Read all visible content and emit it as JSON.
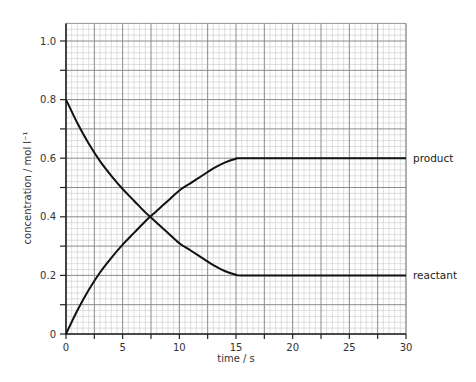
{
  "chart_data": {
    "type": "line",
    "title": "",
    "xlabel": "time / s",
    "ylabel": "concentration / mol l⁻¹",
    "xlim": [
      0,
      30
    ],
    "ylim": [
      0,
      1.06
    ],
    "x_ticks": [
      0,
      5,
      10,
      15,
      20,
      25,
      30
    ],
    "x_tick_labels": [
      "0",
      "5",
      "10",
      "15",
      "20",
      "25",
      "30"
    ],
    "x_minor_ticks": [
      2.5,
      7.5,
      12.5,
      17.5,
      22.5,
      27.5
    ],
    "y_ticks": [
      0,
      0.2,
      0.4,
      0.6,
      0.8,
      1.0
    ],
    "y_tick_labels": [
      "0",
      "0.2",
      "0.4",
      "0.6",
      "0.8",
      "1.0"
    ],
    "y_minor_ticks": [
      0.1,
      0.3,
      0.5,
      0.7,
      0.9
    ],
    "grid": {
      "on": true,
      "major_x": 2.5,
      "major_y": 0.1,
      "minor_x": 0.5,
      "minor_y": 0.02
    },
    "legend": {
      "position": "right-inline"
    },
    "series": [
      {
        "name": "product",
        "label": "product",
        "x": [
          0,
          1,
          2,
          3,
          4,
          5,
          6,
          7,
          8,
          9,
          10,
          11,
          12,
          13,
          14,
          15,
          15.5,
          20,
          25,
          30
        ],
        "values": [
          0,
          0.08,
          0.15,
          0.21,
          0.26,
          0.305,
          0.345,
          0.385,
          0.42,
          0.455,
          0.49,
          0.515,
          0.54,
          0.565,
          0.585,
          0.598,
          0.6,
          0.6,
          0.6,
          0.6
        ]
      },
      {
        "name": "reactant",
        "label": "reactant",
        "x": [
          0,
          1,
          2,
          3,
          4,
          5,
          6,
          7,
          8,
          9,
          10,
          11,
          12,
          13,
          14,
          15,
          15.5,
          20,
          25,
          30
        ],
        "values": [
          0.8,
          0.72,
          0.65,
          0.59,
          0.54,
          0.495,
          0.455,
          0.415,
          0.38,
          0.345,
          0.31,
          0.285,
          0.26,
          0.235,
          0.215,
          0.202,
          0.2,
          0.2,
          0.2,
          0.2
        ]
      }
    ],
    "annotations": [
      {
        "text": "product",
        "x": 30,
        "y": 0.6
      },
      {
        "text": "reactant",
        "x": 30,
        "y": 0.2
      }
    ]
  }
}
